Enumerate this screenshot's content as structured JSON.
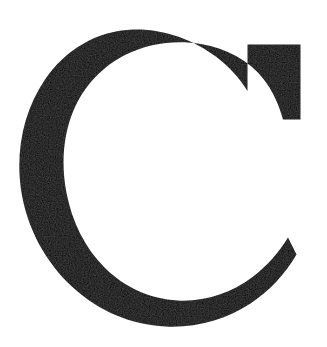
{
  "page": {
    "kind": "scanned-glyph-image",
    "width": 327,
    "height": 347,
    "background_color": "#ffffff"
  },
  "glyph": {
    "character": "C",
    "name": "latin-capital-letter-c",
    "style": "serif",
    "weight": "regular",
    "ink_color": "#0d0b0a",
    "paper_color": "#ffffff",
    "accessible_label": "Letter C",
    "bounds": {
      "left": 20,
      "top": 29,
      "right": 301,
      "bottom": 327
    },
    "metrics": {
      "stroke_thick_px": 52,
      "stroke_thin_top_px": 19,
      "stroke_thin_bottom_px": 22,
      "aperture_top_y": 125,
      "aperture_bottom_y": 250
    },
    "terminals": {
      "upper": "flat vertical serif at right edge",
      "lower": "tapered point"
    }
  }
}
